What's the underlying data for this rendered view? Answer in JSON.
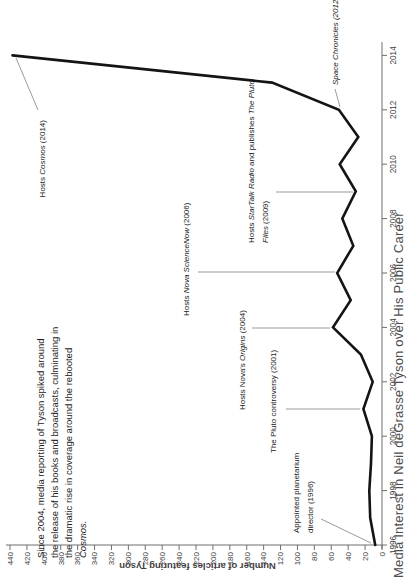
{
  "chart_data": {
    "type": "line",
    "title": "Media Interest in Neil deGrasse Tyson over His Public Career",
    "y_axis_title": "Number of articles featuring Tyson",
    "x": [
      1996,
      1997,
      1998,
      1999,
      2000,
      2001,
      2002,
      2003,
      2004,
      2005,
      2006,
      2007,
      2008,
      2009,
      2010,
      2011,
      2012,
      2013,
      2014
    ],
    "values": [
      8,
      14,
      15,
      13,
      12,
      22,
      11,
      25,
      58,
      37,
      53,
      34,
      47,
      31,
      50,
      28,
      51,
      130,
      437
    ],
    "x_tick_labels": [
      "1996",
      "1998",
      "2000",
      "2002",
      "2004",
      "2006",
      "2008",
      "2010",
      "2012",
      "2014"
    ],
    "y_ticks": [
      0,
      20,
      40,
      60,
      80,
      100,
      120,
      140,
      160,
      180,
      200,
      220,
      240,
      260,
      280,
      300,
      320,
      340,
      360,
      380,
      400,
      420,
      440
    ],
    "ylim": [
      0,
      440
    ],
    "xlim": [
      1996,
      2014
    ],
    "grid": false,
    "legend": "none",
    "orientation": "page rotated 90deg counter-clockwise",
    "colors": {
      "line": "#141414",
      "axis": "#6e6e6e",
      "tick_label": "#3f3f3f",
      "leader": "#9b9b9b",
      "annotation_text": "#1a1a1a",
      "title_text": "#4d4d4d"
    },
    "annotations": [
      {
        "id": "planetarium-1996",
        "year": 1996,
        "lines": [
          "Appointed planetarium",
          "director (1996)"
        ]
      },
      {
        "id": "pluto-2001",
        "year": 2001,
        "lines": [
          "The Pluto controversy (2001)"
        ]
      },
      {
        "id": "origins-2004",
        "year": 2004,
        "lines": [
          "Hosts Nova's *Origins* (2004)"
        ]
      },
      {
        "id": "sciencenow-2006",
        "year": 2006,
        "lines": [
          "Hosts *Nova ScienceNow* (2006)"
        ]
      },
      {
        "id": "startalk-2009",
        "year": 2009,
        "lines": [
          "Hosts *StarTalk Radio* and publishes *The Pluto*",
          "*Files* (2009)"
        ]
      },
      {
        "id": "space-chronicles-2012",
        "year": 2012,
        "lines": [
          "*Space Chronicles (2012)*"
        ]
      },
      {
        "id": "cosmos-2014",
        "year": 2014,
        "lines": [
          "Hosts *Cosmos* (2014)"
        ]
      }
    ],
    "commentary": {
      "lines": [
        "Since 2004, media reporting of Tyson spiked around",
        "the release of his books and broadcasts, culminating in",
        "the dramatic rise in coverage around the rebooted",
        "*Cosmos.*"
      ]
    }
  }
}
